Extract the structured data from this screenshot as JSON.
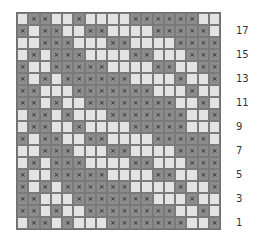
{
  "chart": {
    "columns": 18,
    "rows": 18,
    "colors": {
      "filled": "#8d8d8d",
      "empty": "#e3e3e3",
      "border": "#6f6f6f"
    },
    "symbol": "×",
    "grid": [
      "011001000011111100",
      "101100110000111110",
      "001110001100001111",
      "010111000011000111",
      "100111110000110011",
      "101011111100001001",
      "110001111111000100",
      "110100111111110010",
      "011010001111111001",
      "011001000011111000",
      "101100110000111110",
      "001110001100001111",
      "010111000011000111",
      "100111110000110011",
      "101011111100001001",
      "110001111111000100",
      "110100111111110010",
      "011010001111111001"
    ],
    "row_labels": [
      {
        "row": 2,
        "text": "17"
      },
      {
        "row": 4,
        "text": "15"
      },
      {
        "row": 6,
        "text": "13"
      },
      {
        "row": 8,
        "text": "11"
      },
      {
        "row": 10,
        "text": "9"
      },
      {
        "row": 12,
        "text": "7"
      },
      {
        "row": 14,
        "text": "5"
      },
      {
        "row": 16,
        "text": "3"
      },
      {
        "row": 18,
        "text": "1"
      }
    ]
  }
}
